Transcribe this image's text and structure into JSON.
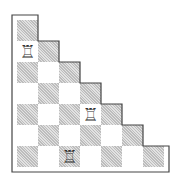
{
  "board": {
    "rows": 7,
    "shape": "staircase-triangle",
    "square_size": 21,
    "origin": {
      "x": 17,
      "y": 20
    },
    "colors": {
      "dark": "#d4d4d4",
      "light": "#ffffff",
      "border": "#444444"
    },
    "pieces": [
      {
        "type": "rook",
        "glyph": "♖",
        "row": 2,
        "col": 1
      },
      {
        "type": "rook",
        "glyph": "♖",
        "row": 5,
        "col": 4
      },
      {
        "type": "rook",
        "glyph": "♖",
        "row": 7,
        "col": 3
      }
    ]
  }
}
